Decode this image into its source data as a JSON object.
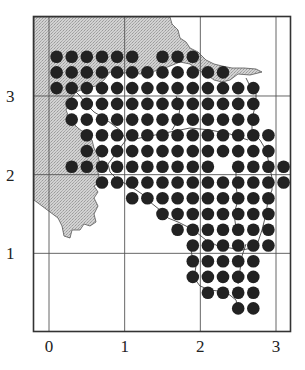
{
  "figure": {
    "type": "dot-grid-map",
    "frame": {
      "x0": -0.2,
      "x1": 3.2,
      "y0": 0.0,
      "y1": 4.0
    },
    "x_ticks": [
      "0",
      "1",
      "2",
      "3"
    ],
    "y_ticks": [
      "1",
      "2",
      "3"
    ],
    "grid_lines": {
      "x": [
        0,
        1,
        2,
        3
      ],
      "y": [
        1,
        2,
        3
      ]
    },
    "colors": {
      "land_shading": "#c8c8c8",
      "dot": "#222222",
      "frame": "#333333",
      "grid": "#555555",
      "boundary": "#444444"
    },
    "dot_spacing": 0.2,
    "dot_rows": [
      {
        "y": 3.5,
        "x_ranges": [
          [
            0.1,
            1.1
          ],
          [
            1.5,
            1.9
          ]
        ]
      },
      {
        "y": 3.3,
        "x_ranges": [
          [
            0.1,
            2.3
          ]
        ]
      },
      {
        "y": 3.1,
        "x_ranges": [
          [
            0.1,
            2.7
          ]
        ]
      },
      {
        "y": 2.9,
        "x_ranges": [
          [
            0.3,
            2.7
          ]
        ]
      },
      {
        "y": 2.7,
        "x_ranges": [
          [
            0.3,
            2.7
          ]
        ]
      },
      {
        "y": 2.5,
        "x_ranges": [
          [
            0.5,
            2.9
          ]
        ]
      },
      {
        "y": 2.3,
        "x_ranges": [
          [
            0.5,
            2.9
          ]
        ]
      },
      {
        "y": 2.1,
        "x_ranges": [
          [
            0.3,
            2.1
          ],
          [
            2.5,
            3.1
          ]
        ]
      },
      {
        "y": 1.9,
        "x_ranges": [
          [
            0.7,
            3.1
          ]
        ]
      },
      {
        "y": 1.7,
        "x_ranges": [
          [
            1.1,
            2.9
          ]
        ]
      },
      {
        "y": 1.5,
        "x_ranges": [
          [
            1.5,
            2.9
          ]
        ]
      },
      {
        "y": 1.3,
        "x_ranges": [
          [
            1.7,
            2.9
          ]
        ]
      },
      {
        "y": 1.1,
        "x_ranges": [
          [
            1.9,
            2.9
          ]
        ]
      },
      {
        "y": 0.9,
        "x_ranges": [
          [
            1.9,
            2.7
          ]
        ]
      },
      {
        "y": 0.7,
        "x_ranges": [
          [
            1.9,
            2.7
          ]
        ]
      },
      {
        "y": 0.5,
        "x_ranges": [
          [
            2.1,
            2.7
          ]
        ]
      },
      {
        "y": 0.3,
        "x_ranges": [
          [
            2.5,
            2.7
          ]
        ]
      }
    ]
  }
}
